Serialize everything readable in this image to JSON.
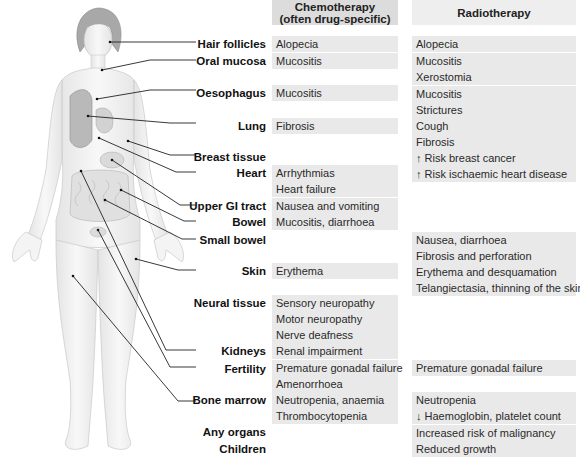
{
  "headers": {
    "chemo": "Chemotherapy\n(often drug-specific)",
    "chemo_line1": "Chemotherapy",
    "chemo_line2": "(often drug-specific)",
    "radio": "Radiotherapy"
  },
  "organs": [
    {
      "label": "Hair follicles",
      "y": 37
    },
    {
      "label": "Oral mucosa",
      "y": 54
    },
    {
      "label": "Oesophagus",
      "y": 86
    },
    {
      "label": "Lung",
      "y": 119
    },
    {
      "label": "Breast tissue",
      "y": 150
    },
    {
      "label": "Heart",
      "y": 166
    },
    {
      "label": "Upper GI tract",
      "y": 199
    },
    {
      "label": "Bowel",
      "y": 215
    },
    {
      "label": "Small bowel",
      "y": 233
    },
    {
      "label": "Skin",
      "y": 264
    },
    {
      "label": "Neural tissue",
      "y": 296
    },
    {
      "label": "Kidneys",
      "y": 344
    },
    {
      "label": "Fertility",
      "y": 362
    },
    {
      "label": "Bone marrow",
      "y": 393
    },
    {
      "label": "Any organs",
      "y": 425
    },
    {
      "label": "Children",
      "y": 442
    }
  ],
  "chemotherapy": [
    {
      "organ": "Hair follicles",
      "y": 36,
      "items": [
        "Alopecia"
      ]
    },
    {
      "organ": "Oral mucosa",
      "y": 53,
      "items": [
        "Mucositis"
      ]
    },
    {
      "organ": "Oesophagus",
      "y": 85,
      "items": [
        "Mucositis"
      ]
    },
    {
      "organ": "Lung",
      "y": 118,
      "items": [
        "Fibrosis"
      ]
    },
    {
      "organ": "Heart",
      "y": 165,
      "items": [
        "Arrhythmias",
        "Heart failure"
      ]
    },
    {
      "organ": "Upper GI tract",
      "y": 198,
      "items": [
        "Nausea and vomiting"
      ]
    },
    {
      "organ": "Bowel",
      "y": 214,
      "items": [
        "Mucositis, diarrhoea"
      ]
    },
    {
      "organ": "Skin",
      "y": 263,
      "items": [
        "Erythema"
      ]
    },
    {
      "organ": "Neural tissue",
      "y": 295,
      "items": [
        "Sensory neuropathy",
        "Motor neuropathy",
        "Nerve deafness"
      ]
    },
    {
      "organ": "Kidneys",
      "y": 343,
      "items": [
        "Renal impairment"
      ]
    },
    {
      "organ": "Fertility",
      "y": 360,
      "items": [
        "Premature gonadal failure",
        "Amenorrhoea"
      ]
    },
    {
      "organ": "Bone marrow",
      "y": 392,
      "items": [
        "Neutropenia, anaemia",
        "Thrombocytopenia"
      ]
    }
  ],
  "radiotherapy": [
    {
      "organ": "Hair follicles",
      "y": 36,
      "items": [
        "Alopecia"
      ]
    },
    {
      "organ": "Oral mucosa",
      "y": 53,
      "items": [
        "Mucositis",
        "Xerostomia"
      ]
    },
    {
      "organ": "Oesophagus",
      "y": 86,
      "items": [
        "Mucositis",
        "Strictures"
      ]
    },
    {
      "organ": "Lung",
      "y": 118,
      "items": [
        "Cough",
        "Fibrosis"
      ]
    },
    {
      "organ": "Breast tissue",
      "y": 150,
      "items": [
        "↑ Risk breast cancer"
      ]
    },
    {
      "organ": "Heart",
      "y": 166,
      "items": [
        "↑ Risk ischaemic heart disease"
      ]
    },
    {
      "organ": "Small bowel",
      "y": 232,
      "items": [
        "Nausea, diarrhoea",
        "Fibrosis and perforation"
      ]
    },
    {
      "organ": "Skin",
      "y": 264,
      "items": [
        "Erythema and desquamation",
        "Telangiectasia, thinning of the skin"
      ]
    },
    {
      "organ": "Fertility",
      "y": 360,
      "items": [
        "Premature gonadal failure"
      ]
    },
    {
      "organ": "Bone marrow",
      "y": 392,
      "items": [
        "Neutropenia",
        "↓ Haemoglobin, platelet count"
      ]
    },
    {
      "organ": "Any organs",
      "y": 425,
      "items": [
        "Increased risk of malignancy"
      ]
    },
    {
      "organ": "Children",
      "y": 441,
      "items": [
        "Reduced growth"
      ]
    }
  ],
  "colors": {
    "chemo_header_bg": "#dcdcdc",
    "radio_header_bg": "#eeeeee",
    "cell_bg": "#e9e9e9",
    "body_fill": "#f2f2f2",
    "hair": "#a8a8a8",
    "leader_line": "#222222"
  }
}
